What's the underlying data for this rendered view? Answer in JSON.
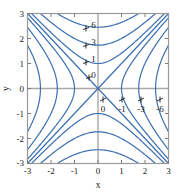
{
  "figure": {
    "background_color": "#ffffff",
    "plot_frame_color": "#9a9a9a",
    "axis_line_color": "#a8a8a8",
    "contour_color": "#3b6fb0",
    "text_color": "#1a1a1a"
  },
  "chart_data": {
    "type": "line",
    "subtype": "contour",
    "title": "",
    "xlabel": "x",
    "ylabel": "y",
    "xlim": [
      -3,
      3
    ],
    "ylim": [
      -3,
      3
    ],
    "grid": false,
    "legend": "none",
    "xticks": [
      "-3",
      "-2",
      "-1",
      "0",
      "1",
      "2",
      "3"
    ],
    "xtick_values": [
      -3,
      -2,
      -1,
      0,
      1,
      2,
      3
    ],
    "yticks": [
      "3",
      "2",
      "1",
      "0",
      "-1",
      "-2",
      "-3"
    ],
    "ytick_values": [
      3,
      2,
      1,
      0,
      -1,
      -2,
      -3
    ],
    "function": "z = y^2 - x^2",
    "contour_levels": [
      -6,
      -3,
      -1,
      0,
      1,
      3,
      6
    ],
    "inline_labels": [
      {
        "text": "6",
        "level": 6,
        "x": 2.55,
        "y": -0.5
      },
      {
        "text": "3",
        "level": 3,
        "x": 1.78,
        "y": -0.5
      },
      {
        "text": "1",
        "level": 1,
        "x": 1.08,
        "y": -0.5
      },
      {
        "text": "0",
        "level": 0,
        "x": 0.2,
        "y": -0.52
      },
      {
        "text": "0",
        "level": 0,
        "x": -0.42,
        "y": 0.52
      },
      {
        "text": "-1",
        "level": -1,
        "x": -0.45,
        "y": 1.12
      },
      {
        "text": "-3",
        "level": -3,
        "x": -0.45,
        "y": 1.92
      },
      {
        "text": "-6",
        "level": -6,
        "x": -0.45,
        "y": 2.65
      }
    ],
    "top_labels": [
      "6",
      "3",
      "1",
      "0"
    ],
    "bottom_labels": [
      "0",
      "-1",
      "-3",
      "-6"
    ],
    "series": [
      {
        "name": "level 6 upper",
        "level": 6
      },
      {
        "name": "level 3 upper",
        "level": 3
      },
      {
        "name": "level 1 upper",
        "level": 1
      },
      {
        "name": "level 0 asymptote",
        "level": 0
      },
      {
        "name": "level -1 right",
        "level": -1
      },
      {
        "name": "level -3 right",
        "level": -3
      },
      {
        "name": "level -6 right",
        "level": -6
      }
    ]
  }
}
